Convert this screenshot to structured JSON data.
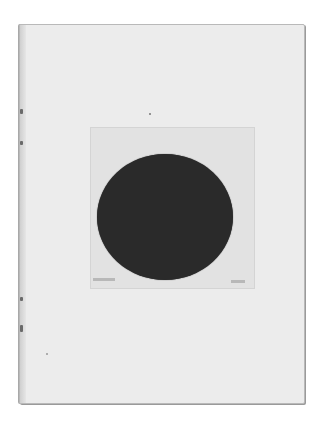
{
  "scene": {
    "description": "Photograph of an open book page with a mounted plate showing a black circle",
    "colors": {
      "background": "#ffffff",
      "page": "#ececec",
      "plate": "#e2e2e2",
      "circle": "#2a2a2a"
    }
  }
}
